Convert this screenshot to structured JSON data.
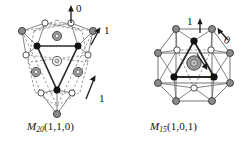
{
  "figure": {
    "background_color": "#ffffff",
    "panels": [
      {
        "id": "M20",
        "caption_symbol": "M",
        "caption_subscript": "20",
        "caption_indices": "(1,1,0)",
        "caption_full": "M20(1,1,0)",
        "labels": [
          {
            "text": "0",
            "kind": "arrow-label",
            "direction": "up",
            "x": 78,
            "y": 13
          },
          {
            "text": "1",
            "kind": "arrow-label",
            "direction": "up-right",
            "x": 101,
            "y": 37
          },
          {
            "text": "1",
            "kind": "arrow-label",
            "direction": "up-right",
            "x": 97,
            "y": 97
          }
        ],
        "arrows": [
          {
            "name": "arrow-0",
            "x1": 71,
            "y1": 23,
            "x2": 71,
            "y2": 7,
            "style": "solid"
          },
          {
            "name": "arrow-1a",
            "x1": 92,
            "y1": 45,
            "x2": 99,
            "y2": 30,
            "style": "solid"
          },
          {
            "name": "arrow-1b",
            "x1": 87,
            "y1": 98,
            "x2": 95,
            "y2": 77,
            "style": "solid"
          }
        ],
        "node_groups": [
          {
            "type": "gray-vertex",
            "color": "#8a8a8a",
            "count": 4
          },
          {
            "type": "open-vertex",
            "color": "#ffffff",
            "count": 6
          },
          {
            "type": "black-vertex",
            "color": "#141414",
            "count": 4
          },
          {
            "type": "donut-atom",
            "color": "#9a9a9a",
            "count": 5
          }
        ]
      },
      {
        "id": "M15",
        "caption_symbol": "M",
        "caption_subscript": "15",
        "caption_indices": "(1,0,1)",
        "caption_full": "M15(1,0,1)",
        "labels": [
          {
            "text": "1",
            "kind": "arrow-label",
            "direction": "up",
            "x": 190,
            "y": 18
          },
          {
            "text": "0",
            "kind": "arrow-label",
            "direction": "up-right",
            "x": 222,
            "y": 34
          },
          {
            "text": "1",
            "kind": "arrow-label",
            "direction": "down-right",
            "x": 214,
            "y": 75
          }
        ],
        "arrows": [
          {
            "name": "arrow-1a",
            "x1": 201,
            "y1": 30,
            "x2": 201,
            "y2": 18,
            "style": "solid"
          },
          {
            "name": "arrow-0",
            "x1": 217,
            "y1": 40,
            "x2": 226,
            "y2": 28,
            "style": "solid"
          },
          {
            "name": "arrow-1b",
            "x1": 197,
            "y1": 55,
            "x2": 207,
            "y2": 69,
            "style": "solid"
          }
        ],
        "node_groups": [
          {
            "type": "gray-vertex",
            "color": "#8a8a8a",
            "count": 8
          },
          {
            "type": "open-vertex",
            "color": "#ffffff",
            "count": 5
          },
          {
            "type": "black-vertex",
            "color": "#141414",
            "count": 3
          },
          {
            "type": "donut-atom",
            "color": "#9a9a9a",
            "count": 1
          }
        ]
      }
    ],
    "style": {
      "edge_solid_color": "#2b2b2b",
      "edge_thin_color": "#6e6e6e",
      "edge_dashed_color": "#7a7a7a",
      "node_stroke_color": "#3a3a3a"
    }
  }
}
